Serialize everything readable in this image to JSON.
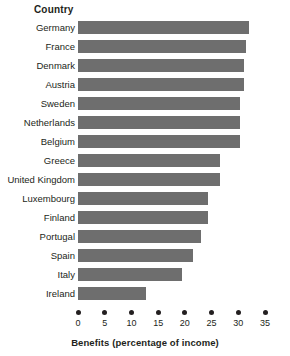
{
  "chart_data": {
    "type": "bar",
    "orientation": "horizontal",
    "title": "",
    "xlabel": "Benefits (percentage of income)",
    "ylabel": "Country",
    "xlim": [
      0,
      35
    ],
    "xticks": [
      0,
      5,
      10,
      15,
      20,
      25,
      30,
      35
    ],
    "grid": false,
    "legend": false,
    "bar_color": "#6e6e6e",
    "categories": [
      "Germany",
      "France",
      "Denmark",
      "Austria",
      "Sweden",
      "Netherlands",
      "Belgium",
      "Greece",
      "United Kingdom",
      "Luxembourg",
      "Finland",
      "Portugal",
      "Spain",
      "Italy",
      "Ireland"
    ],
    "values": [
      32,
      31.5,
      31,
      31,
      30.3,
      30.3,
      30.3,
      26.6,
      26.6,
      24.3,
      24.3,
      23,
      21.5,
      19.5,
      12.7
    ]
  },
  "axis": {
    "category_header": "Country",
    "value_title": "Benefits (percentage of income)",
    "tick_labels": [
      "0",
      "5",
      "10",
      "15",
      "20",
      "25",
      "30",
      "35"
    ]
  },
  "rows": [
    {
      "label": "Germany",
      "value": 32
    },
    {
      "label": "France",
      "value": 31.5
    },
    {
      "label": "Denmark",
      "value": 31
    },
    {
      "label": "Austria",
      "value": 31
    },
    {
      "label": "Sweden",
      "value": 30.3
    },
    {
      "label": "Netherlands",
      "value": 30.3
    },
    {
      "label": "Belgium",
      "value": 30.3
    },
    {
      "label": "Greece",
      "value": 26.6
    },
    {
      "label": "United Kingdom",
      "value": 26.6
    },
    {
      "label": "Luxembourg",
      "value": 24.3
    },
    {
      "label": "Finland",
      "value": 24.3
    },
    {
      "label": "Portugal",
      "value": 23
    },
    {
      "label": "Spain",
      "value": 21.5
    },
    {
      "label": "Italy",
      "value": 19.5
    },
    {
      "label": "Ireland",
      "value": 12.7
    }
  ]
}
